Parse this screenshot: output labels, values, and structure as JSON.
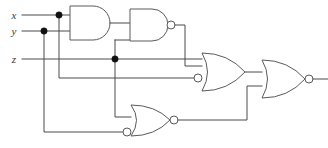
{
  "diagram": {
    "type": "combinational-logic-circuit",
    "background_color": "#ffffff",
    "wire_color": "#4a4a4a",
    "gate_outline_color": "#5a5a5a",
    "junction_color": "#111111",
    "label_color": "#3a3a3a"
  },
  "inputs": [
    {
      "id": "x",
      "label": "x",
      "y": 15
    },
    {
      "id": "y",
      "label": "y",
      "y": 31
    },
    {
      "id": "z",
      "label": "z",
      "y": 59
    }
  ],
  "gates": [
    {
      "id": "g1",
      "name": "and-gate",
      "type": "AND",
      "output_bubble": false,
      "input_bubbles": [],
      "inputs": [
        "x",
        "y"
      ]
    },
    {
      "id": "g2",
      "name": "nand-gate",
      "type": "NAND",
      "output_bubble": true,
      "input_bubbles": [],
      "inputs": [
        "g1",
        "z"
      ]
    },
    {
      "id": "g3",
      "name": "or-gate-inverted-input",
      "type": "OR",
      "output_bubble": false,
      "input_bubbles": [
        "lower"
      ],
      "inputs": [
        "g2",
        "x"
      ]
    },
    {
      "id": "g4",
      "name": "nor-gate-inverted-input",
      "type": "NOR",
      "output_bubble": true,
      "input_bubbles": [
        "lower"
      ],
      "inputs": [
        "z",
        "y"
      ]
    },
    {
      "id": "g5",
      "name": "output-nor-gate",
      "type": "NOR",
      "output_bubble": true,
      "input_bubbles": [],
      "inputs": [
        "g3",
        "g4"
      ]
    }
  ],
  "junctions": [
    {
      "id": "j-x",
      "on": "x",
      "x": 59,
      "y": 15
    },
    {
      "id": "j-y",
      "on": "y",
      "x": 44,
      "y": 31
    },
    {
      "id": "j-z",
      "on": "z",
      "x": 115,
      "y": 59
    }
  ]
}
